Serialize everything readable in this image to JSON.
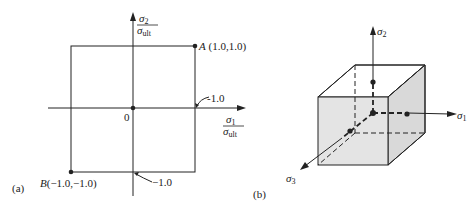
{
  "panel_a": {
    "label": "(a)",
    "y_axis_label_num": "σ",
    "y_axis_label_num_sub": "2",
    "y_axis_label_den": "σ",
    "y_axis_label_den_sub": "ult",
    "x_axis_label_num": "σ",
    "x_axis_label_num_sub": "1",
    "x_axis_label_den": "σ",
    "x_axis_label_den_sub": "ult",
    "origin_label": "0",
    "point_a_label": "A (1.0,1.0)",
    "point_b_label": "B (−1.0, −1.0)",
    "tick_x_pos_label": "1.0",
    "tick_x_pos_label_full": "-1.0",
    "tick_y_neg_label": "−1.0",
    "tick_right_label": "−1.0"
  },
  "panel_b": {
    "label": "(b)",
    "axis_1_label": "σ",
    "axis_1_sub": "1",
    "axis_2_label": "σ",
    "axis_2_sub": "2",
    "axis_3_label": "σ",
    "axis_3_sub": "3"
  },
  "colors": {
    "line": "#222222",
    "face_fill": "#e6e6e6",
    "side_fill": "#d9d9d9"
  }
}
